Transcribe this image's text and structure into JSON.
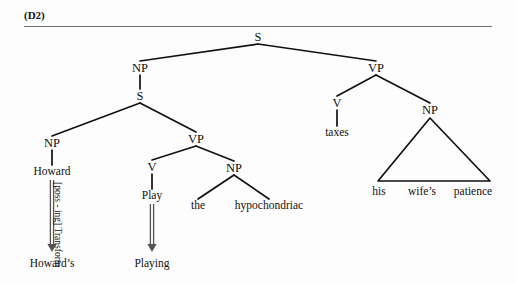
{
  "figure": {
    "caption": "(D2)",
    "colors": {
      "ink": "#111111",
      "rule": "#6f6f6f",
      "arrow": "#555555",
      "background": "#fdfdfd"
    }
  },
  "tree": {
    "nodes": [
      {
        "id": "s-root",
        "label": "S",
        "x": 258,
        "y": 37,
        "kind": "node"
      },
      {
        "id": "np-subj",
        "label": "NP",
        "x": 140,
        "y": 68,
        "kind": "node"
      },
      {
        "id": "vp-main",
        "label": "VP",
        "x": 376,
        "y": 68,
        "kind": "node"
      },
      {
        "id": "s-embed",
        "label": "S",
        "x": 140,
        "y": 96,
        "kind": "node"
      },
      {
        "id": "v-main",
        "label": "V",
        "x": 337,
        "y": 103,
        "kind": "node"
      },
      {
        "id": "np-obj2",
        "label": "NP",
        "x": 430,
        "y": 110,
        "kind": "node"
      },
      {
        "id": "np-howard",
        "label": "NP",
        "x": 52,
        "y": 143,
        "kind": "node"
      },
      {
        "id": "vp-embed",
        "label": "VP",
        "x": 196,
        "y": 139,
        "kind": "node"
      },
      {
        "id": "v-play",
        "label": "V",
        "x": 152,
        "y": 167,
        "kind": "node"
      },
      {
        "id": "np-obj1",
        "label": "NP",
        "x": 234,
        "y": 168,
        "kind": "node"
      }
    ],
    "terminals": [
      {
        "id": "w-howard",
        "label": "Howard",
        "x": 52,
        "y": 172
      },
      {
        "id": "w-taxes",
        "label": "taxes",
        "x": 337,
        "y": 133
      },
      {
        "id": "w-play",
        "label": "Play",
        "x": 152,
        "y": 196
      },
      {
        "id": "w-the",
        "label": "the",
        "x": 198,
        "y": 206
      },
      {
        "id": "w-hypochondriac",
        "label": "hypochondriac",
        "x": 269,
        "y": 206
      },
      {
        "id": "w-his",
        "label": "his",
        "x": 379,
        "y": 192
      },
      {
        "id": "w-wifes",
        "label": "wife’s",
        "x": 422,
        "y": 192
      },
      {
        "id": "w-patience",
        "label": "patience",
        "x": 473,
        "y": 192
      }
    ],
    "edges": [
      {
        "from": "s-root",
        "to": "np-subj"
      },
      {
        "from": "s-root",
        "to": "vp-main"
      },
      {
        "from": "np-subj",
        "to": "s-embed"
      },
      {
        "from": "s-embed",
        "to": "np-howard"
      },
      {
        "from": "s-embed",
        "to": "vp-embed"
      },
      {
        "from": "np-howard",
        "to": "w-howard"
      },
      {
        "from": "vp-embed",
        "to": "v-play"
      },
      {
        "from": "vp-embed",
        "to": "np-obj1"
      },
      {
        "from": "v-play",
        "to": "w-play"
      },
      {
        "from": "np-obj1",
        "to": "w-the"
      },
      {
        "from": "np-obj1",
        "to": "w-hypochondriac"
      },
      {
        "from": "vp-main",
        "to": "v-main"
      },
      {
        "from": "vp-main",
        "to": "np-obj2"
      },
      {
        "from": "v-main",
        "to": "w-taxes"
      }
    ],
    "triangle": {
      "id": "np-triangle",
      "apex_x": 430,
      "apex_y": 118,
      "left_x": 378,
      "right_x": 490,
      "base_y": 181,
      "covers": "his wife’s patience"
    }
  },
  "transformations": [
    {
      "id": "poss-ing",
      "label": "[poss - ing] Transform",
      "arrow_x": 52,
      "arrow_y1": 180,
      "arrow_y2": 252,
      "label_x": 62,
      "label_y": 182,
      "source": "Howard",
      "result": "Howard’s",
      "result_x": 52,
      "result_y": 264
    },
    {
      "id": "play-ing",
      "label": "",
      "arrow_x": 152,
      "arrow_y1": 204,
      "arrow_y2": 252,
      "label_x": 0,
      "label_y": 0,
      "source": "Play",
      "result": "Playing",
      "result_x": 152,
      "result_y": 264
    }
  ]
}
